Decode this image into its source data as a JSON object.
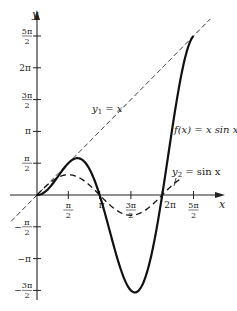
{
  "chart_data": {
    "type": "line",
    "title": "",
    "xlabel": "x",
    "ylabel": "y",
    "xlim": [
      -1.3,
      9.3
    ],
    "ylim": [
      -5.0,
      8.9
    ],
    "grid": false,
    "x_ticks": [
      {
        "value": 1.5708,
        "label_num": "π",
        "label_den": "2",
        "label": "π/2"
      },
      {
        "value": 3.1416,
        "label": "π"
      },
      {
        "value": 4.7124,
        "label_num": "3π",
        "label_den": "2",
        "label": "3π/2"
      },
      {
        "value": 6.2832,
        "label": "2π"
      },
      {
        "value": 7.854,
        "label_num": "5π",
        "label_den": "2",
        "label": "5π/2"
      }
    ],
    "y_ticks": [
      {
        "value": 7.854,
        "label_num": "5π",
        "label_den": "2",
        "label": "5π/2"
      },
      {
        "value": 6.2832,
        "label": "2π"
      },
      {
        "value": 4.7124,
        "label_num": "3π",
        "label_den": "2",
        "label": "3π/2"
      },
      {
        "value": 3.1416,
        "label": "π"
      },
      {
        "value": 1.5708,
        "label_num": "π",
        "label_den": "2",
        "label": "π/2"
      },
      {
        "value": -1.5708,
        "label_num": "π",
        "label_den": "2",
        "label": "−π/2",
        "neg": true
      },
      {
        "value": -3.1416,
        "label": "−π"
      },
      {
        "value": -4.7124,
        "label_num": "3π",
        "label_den": "2",
        "label": "−3π/2",
        "neg": true
      }
    ],
    "series": [
      {
        "name": "f(x) = x sin x",
        "label": "f(x) = x sin x",
        "style": "solid-thick",
        "x_range": [
          0,
          7.854
        ],
        "expr": "x*sin(x)"
      },
      {
        "name": "y1 = x",
        "label": "y1 = x",
        "style": "dashed",
        "x_range": [
          -1.3,
          8.7
        ],
        "expr": "x"
      },
      {
        "name": "y2 = sin x",
        "label": "y2 = sin x",
        "style": "dashed",
        "x_range": [
          0,
          7.3
        ],
        "expr": "sin(x)"
      }
    ],
    "sample_points": {
      "f": [
        [
          0,
          0
        ],
        [
          1.5708,
          1.5708
        ],
        [
          3.1416,
          0
        ],
        [
          4.9132,
          -4.8145
        ],
        [
          6.2832,
          0
        ],
        [
          7.854,
          7.854
        ]
      ],
      "y1": [
        [
          -1.3,
          -1.3
        ],
        [
          8.7,
          8.7
        ]
      ],
      "y2": [
        [
          0,
          0
        ],
        [
          1.5708,
          1
        ],
        [
          3.1416,
          0
        ],
        [
          4.7124,
          -1
        ],
        [
          6.2832,
          0
        ],
        [
          7.3,
          0.86
        ]
      ]
    },
    "annotations": [
      {
        "text": "y1 = x",
        "near": [
          2.6,
          4.5
        ]
      },
      {
        "text": "f(x) = x sin x",
        "near": [
          6.8,
          3.5
        ]
      },
      {
        "text": "y2 = sin x",
        "near": [
          6.8,
          1.2
        ]
      }
    ]
  },
  "labels": {
    "x_axis": "x",
    "y_axis": "y",
    "y1_prefix": "y",
    "y1_sub": "1",
    "y1_rest": " = x",
    "f_label": "f(x) = x sin x",
    "y2_prefix": "y",
    "y2_sub": "2",
    "y2_rest": " = sin x"
  }
}
